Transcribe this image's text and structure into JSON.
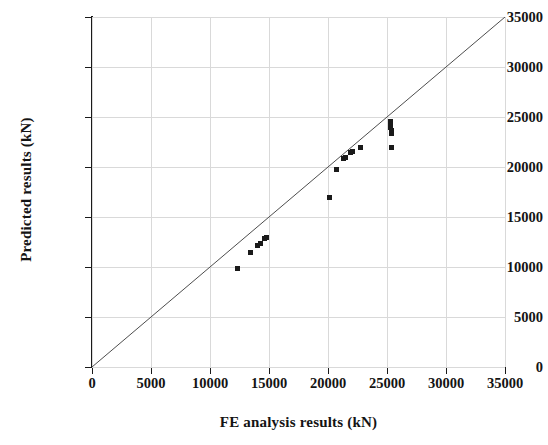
{
  "chart_data": {
    "type": "scatter",
    "title": "",
    "xlabel": "FE analysis results (kN)",
    "ylabel": "Predicted results (kN)",
    "xlim": [
      0,
      35000
    ],
    "ylim": [
      0,
      35000
    ],
    "xticks": [
      0,
      5000,
      10000,
      15000,
      20000,
      25000,
      30000,
      35000
    ],
    "yticks": [
      0,
      5000,
      10000,
      15000,
      20000,
      25000,
      30000,
      35000
    ],
    "xticklabels": [
      "0",
      "5000",
      "10000",
      "15000",
      "20000",
      "25000",
      "30000",
      "35000"
    ],
    "yticklabels": [
      "0",
      "5000",
      "10000",
      "15000",
      "20000",
      "25000",
      "30000",
      "35000"
    ],
    "grid": true,
    "legend": false,
    "series": [
      {
        "name": "Predicted vs FE analysis",
        "marker": "square",
        "color": "#1a1a1a",
        "points": [
          [
            12350,
            9850
          ],
          [
            13400,
            11500
          ],
          [
            14000,
            12150
          ],
          [
            14250,
            12400
          ],
          [
            14600,
            12900
          ],
          [
            14750,
            13000
          ],
          [
            20100,
            17000
          ],
          [
            20700,
            19750
          ],
          [
            21300,
            20850
          ],
          [
            21500,
            21000
          ],
          [
            21900,
            21450
          ],
          [
            22100,
            21550
          ],
          [
            22750,
            22000
          ],
          [
            25300,
            24550
          ],
          [
            25300,
            24250
          ],
          [
            25300,
            23950
          ],
          [
            25350,
            23700
          ],
          [
            25350,
            23400
          ],
          [
            25400,
            22000
          ]
        ]
      }
    ],
    "reference_line": {
      "name": "1:1 identity line",
      "from": [
        0,
        0
      ],
      "to": [
        35000,
        35000
      ],
      "color": "#4d4d4d"
    }
  },
  "axes": {
    "x_label": "FE analysis results (kN)",
    "y_label": "Predicted results (kN)"
  }
}
